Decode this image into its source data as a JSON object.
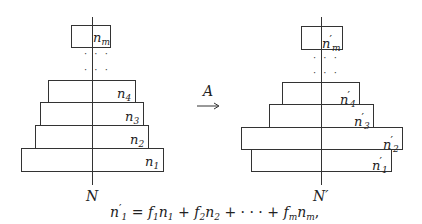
{
  "left_stack": {
    "axis_label": "N",
    "boxes": [
      {
        "var": "n",
        "sub": "m",
        "prime": false
      },
      {
        "var": "n",
        "sub": "4",
        "prime": false
      },
      {
        "var": "n",
        "sub": "3",
        "prime": false
      },
      {
        "var": "n",
        "sub": "2",
        "prime": false
      },
      {
        "var": "n",
        "sub": "1",
        "prime": false
      }
    ],
    "ellipsis": "· · ·"
  },
  "right_stack": {
    "axis_label": "N′",
    "boxes": [
      {
        "var": "n",
        "sub": "m",
        "prime": true
      },
      {
        "var": "n",
        "sub": "4",
        "prime": true
      },
      {
        "var": "n",
        "sub": "3",
        "prime": true
      },
      {
        "var": "n",
        "sub": "2",
        "prime": true
      },
      {
        "var": "n",
        "sub": "1",
        "prime": true
      }
    ],
    "ellipsis": "· · ·"
  },
  "map": {
    "label": "A",
    "symbol": "⟶"
  },
  "equation": {
    "lhs_var": "n",
    "lhs_prime": "′",
    "lhs_sub": "1",
    "equals": "=",
    "terms": [
      {
        "coef": "f",
        "coef_sub": "1",
        "var": "n",
        "var_sub": "1"
      },
      {
        "coef": "f",
        "coef_sub": "2",
        "var": "n",
        "var_sub": "2"
      },
      {
        "coef": "f",
        "coef_sub": "m",
        "var": "n",
        "var_sub": "m"
      }
    ],
    "plus": "+",
    "cdots": "· · ·",
    "trailing": ","
  }
}
